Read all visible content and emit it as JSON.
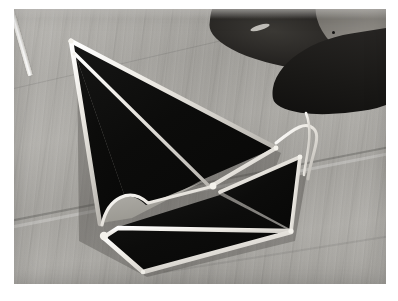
{
  "image": {
    "title": "Stained glass sailboat panel on wooden workbench",
    "medium": "photograph",
    "palette": "grayscale",
    "frame_color": "#ffffff",
    "photo": {
      "x": 14,
      "y": 9,
      "width": 372,
      "height": 275
    }
  },
  "background": {
    "name": "weathered wood workbench",
    "base_color": "#a9a7a2",
    "highlight_color": "#c3c1bc",
    "shadow_color": "#8a8883",
    "plank_seams": 3
  },
  "subject": {
    "name": "leaded stained glass sailboat",
    "glass_color": "#0d0d0d",
    "came_color": "#f2f0ea",
    "came_shadow": "#6f6d68",
    "parts": [
      {
        "label": "mainsail",
        "shape": "large triangle"
      },
      {
        "label": "jib",
        "shape": "narrow triangle"
      },
      {
        "label": "hull",
        "shape": "curved wedge"
      },
      {
        "label": "mast",
        "shape": "straight came line"
      },
      {
        "label": "open cutout",
        "shape": "curved triangular void"
      }
    ]
  },
  "objects": [
    {
      "name": "dark hand tool",
      "position": "top-right",
      "color": "#1a1917"
    },
    {
      "name": "loose lead came strip",
      "position": "upper-left",
      "color": "#f5f3ee"
    },
    {
      "name": "loose lead came strip",
      "position": "right of jib",
      "color": "#efede8"
    }
  ]
}
